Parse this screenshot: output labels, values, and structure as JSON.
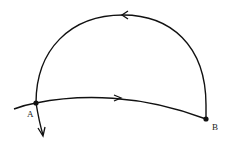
{
  "diagram": {
    "points": [
      {
        "label": "A"
      },
      {
        "label": "B"
      }
    ]
  }
}
